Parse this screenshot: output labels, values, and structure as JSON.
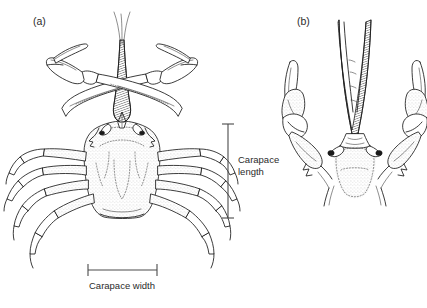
{
  "figure": {
    "background_color": "#ffffff",
    "ink_color": "#1a1a1a",
    "text_color": "#2b2b2b"
  },
  "panels": [
    {
      "id": "a",
      "label": "(a)",
      "description": "whole crab, dorsal view with chelipeds crossed over rostrum"
    },
    {
      "id": "b",
      "label": "(b)",
      "description": "close-up of frontal region showing rostrum and chelipeds"
    }
  ],
  "measurements": [
    {
      "id": "carapace-length",
      "label_line_1": "Carapace",
      "label_line_2": "length",
      "orientation": "vertical"
    },
    {
      "id": "carapace-width",
      "label": "Carapace width",
      "orientation": "horizontal"
    }
  ]
}
